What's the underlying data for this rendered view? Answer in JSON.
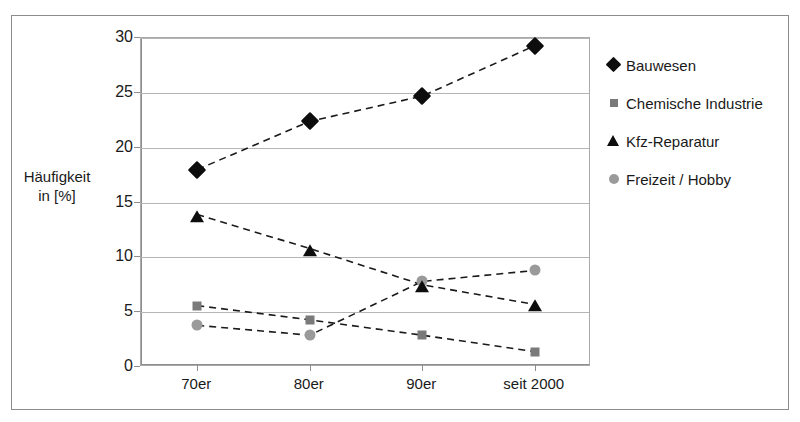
{
  "chart_data": {
    "type": "line",
    "title": "",
    "subtitle": "",
    "xlabel": "",
    "ylabel": "Häufigkeit\nin [%]",
    "ylabel_line1": "Häufigkeit",
    "ylabel_line2": "in [%]",
    "categories": [
      "70er",
      "80er",
      "90er",
      "seit 2000"
    ],
    "ylim": [
      0,
      30
    ],
    "yticks": [
      0,
      5,
      10,
      15,
      20,
      25,
      30
    ],
    "ytick_labels": [
      "0",
      "5",
      "10",
      "15",
      "20",
      "25",
      "30"
    ],
    "grid": true,
    "grid_axis": "y",
    "legend_position": "right",
    "line_style": "dashed",
    "series": [
      {
        "name": "Bauwesen",
        "marker": "diamond",
        "color": "#0d0d0d",
        "values": [
          18.0,
          22.4,
          24.7,
          29.3
        ]
      },
      {
        "name": "Chemische Industrie",
        "marker": "square",
        "color": "#7a7a7a",
        "values": [
          5.6,
          4.3,
          2.9,
          1.4
        ]
      },
      {
        "name": "Kfz-Reparatur",
        "marker": "triangle",
        "color": "#0d0d0d",
        "values": [
          13.9,
          10.8,
          7.5,
          5.7
        ]
      },
      {
        "name": "Freizeit / Hobby",
        "marker": "circle",
        "color": "#9a9a9a",
        "values": [
          3.8,
          2.9,
          7.8,
          8.8
        ]
      }
    ]
  },
  "legend": {
    "items": [
      {
        "label": "Bauwesen",
        "marker": "diamond-marker"
      },
      {
        "label": "Chemische Industrie",
        "marker": "square-marker"
      },
      {
        "label": "Kfz-Reparatur",
        "marker": "triangle-marker"
      },
      {
        "label": "Freizeit / Hobby",
        "marker": "circle-marker"
      }
    ]
  },
  "colors": {
    "series_dark": "#0d0d0d",
    "series_gray": "#7a7a7a",
    "series_light_gray": "#9a9a9a",
    "gridline": "#b5b5b5",
    "axis": "#8d8d8d",
    "frame": "#8d8d8d",
    "background": "#ffffff"
  }
}
